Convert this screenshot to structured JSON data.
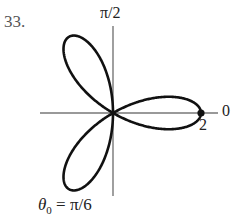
{
  "problem": {
    "number": "33."
  },
  "chart_data": {
    "type": "line",
    "coordinate_system": "polar",
    "title": "",
    "equation_hint": "three-leaved rose, r = 2cos(3θ)",
    "series": [
      {
        "name": "rose",
        "petals": 3,
        "max_r": 2,
        "petal_angles": [
          "0",
          "2π/3",
          "4π/3"
        ]
      }
    ],
    "axis_labels": {
      "top": "π/2",
      "right": "0"
    },
    "tick_labels": [
      "2"
    ],
    "marked_point": {
      "r": 2,
      "theta": 0,
      "label": "2"
    },
    "annotation": "θ0 = π/6",
    "grid": false,
    "legend": null
  },
  "labels": {
    "axis_top": "π/2",
    "axis_right": "0",
    "radius_tick": "2",
    "theta_symbol": "θ",
    "theta_subscript": "0",
    "theta_value": " = π/6"
  },
  "style": {
    "curve_color": "#111111",
    "axis_color": "#777777"
  }
}
